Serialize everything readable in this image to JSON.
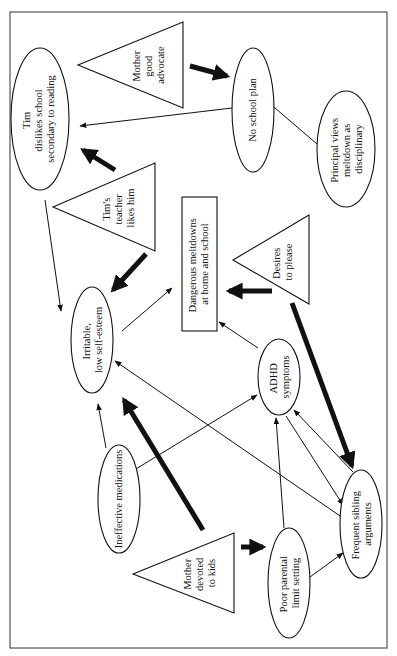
{
  "diagram": {
    "type": "causal concept map (rotated 90°)",
    "nodes": {
      "mother_advocate": {
        "shape": "triangle",
        "lines": [
          "Mother",
          "good",
          "advocate"
        ]
      },
      "tim_dislikes": {
        "shape": "ellipse",
        "lines": [
          "Tim",
          "dislikes school",
          "secondary  to reading"
        ]
      },
      "no_school_plan": {
        "shape": "ellipse",
        "lines": [
          "No school plan"
        ]
      },
      "principal_views": {
        "shape": "ellipse",
        "lines": [
          "Principal views",
          "meltdown as",
          "disciplinary"
        ]
      },
      "teacher_likes": {
        "shape": "triangle",
        "lines": [
          "Tim's",
          "teacher",
          "likes him"
        ]
      },
      "meltdowns": {
        "shape": "rectangle",
        "lines": [
          "Dangerous meltdowns",
          "at home and school"
        ]
      },
      "desires_please": {
        "shape": "triangle",
        "lines": [
          "Desires",
          "to please"
        ]
      },
      "irritable": {
        "shape": "ellipse",
        "lines": [
          "Irritable,",
          "low self-esteem"
        ]
      },
      "adhd": {
        "shape": "ellipse",
        "lines": [
          "ADHD",
          "symptoms"
        ]
      },
      "ineffective_meds": {
        "shape": "ellipse",
        "lines": [
          "Ineffective medications"
        ]
      },
      "mother_devoted": {
        "shape": "triangle",
        "lines": [
          "Mother",
          "devoted",
          "to kids"
        ]
      },
      "poor_limit": {
        "shape": "ellipse",
        "lines": [
          "Poor parental",
          "limit setting"
        ]
      },
      "sibling_args": {
        "shape": "ellipse",
        "lines": [
          "Frequent sibling",
          "arguments"
        ]
      }
    },
    "edges": [
      {
        "from": "Mother good advocate",
        "to": "No school plan",
        "weight": "thick"
      },
      {
        "from": "No school plan",
        "to": "Tim dislikes school",
        "weight": "thin"
      },
      {
        "from": "Principal views meltdown as disciplinary",
        "to": "No school plan",
        "weight": "thin"
      },
      {
        "from": "Tim's teacher likes him",
        "to": "Tim dislikes school",
        "weight": "thick"
      },
      {
        "from": "Tim dislikes school",
        "to": "Irritable, low self-esteem",
        "weight": "thin"
      },
      {
        "from": "Tim's teacher likes him",
        "to": "Irritable, low self-esteem",
        "weight": "thick"
      },
      {
        "from": "Irritable, low self-esteem",
        "to": "Dangerous meltdowns",
        "weight": "thin"
      },
      {
        "from": "Desires to please",
        "to": "Dangerous meltdowns",
        "weight": "thick"
      },
      {
        "from": "ADHD symptoms",
        "to": "Dangerous meltdowns",
        "weight": "thin"
      },
      {
        "from": "Desires to please",
        "to": "Frequent sibling arguments",
        "weight": "thick"
      },
      {
        "from": "Ineffective medications",
        "to": "Irritable, low self-esteem",
        "weight": "thin"
      },
      {
        "from": "Ineffective medications",
        "to": "ADHD symptoms",
        "weight": "thin"
      },
      {
        "from": "Mother devoted to kids",
        "to": "Irritable, low self-esteem",
        "weight": "thick"
      },
      {
        "from": "Frequent sibling arguments",
        "to": "Irritable, low self-esteem",
        "weight": "thin"
      },
      {
        "from": "Poor parental limit setting",
        "to": "ADHD symptoms",
        "weight": "thin"
      },
      {
        "from": "ADHD symptoms",
        "to": "Frequent sibling arguments",
        "weight": "thin"
      },
      {
        "from": "Frequent sibling arguments",
        "to": "ADHD symptoms",
        "weight": "thin"
      },
      {
        "from": "Mother devoted to kids",
        "to": "Poor parental limit setting",
        "weight": "thick"
      },
      {
        "from": "Poor parental limit setting",
        "to": "Frequent sibling arguments",
        "weight": "thin"
      }
    ]
  }
}
